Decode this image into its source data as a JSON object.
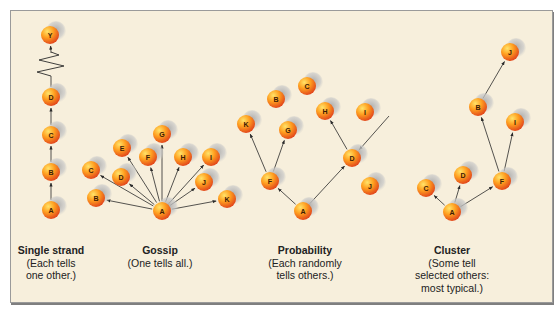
{
  "colors": {
    "background": "#f7efdc",
    "node_fill_light": "#ffd04a",
    "node_fill_dark": "#e8501a",
    "shadow": "#b8b8b8",
    "arrow": "#2a2a2a"
  },
  "panels": [
    {
      "id": "single-strand",
      "title": "Single strand",
      "description": "(Each tells\none other.)",
      "caption_x": 51,
      "nodes": [
        {
          "label": "Y",
          "x": 50,
          "y": 35
        },
        {
          "label": "D",
          "x": 51,
          "y": 97
        },
        {
          "label": "C",
          "x": 51,
          "y": 135
        },
        {
          "label": "B",
          "x": 51,
          "y": 172
        },
        {
          "label": "A",
          "x": 51,
          "y": 210
        }
      ],
      "edges": [
        [
          "A",
          "B"
        ],
        [
          "B",
          "C"
        ],
        [
          "C",
          "D"
        ]
      ],
      "break": {
        "from_y": 80,
        "to_y": 48,
        "x": 51
      }
    },
    {
      "id": "gossip",
      "title": "Gossip",
      "description": "(One tells all.)",
      "caption_x": 160,
      "nodes": [
        {
          "label": "A",
          "x": 162,
          "y": 211
        },
        {
          "label": "B",
          "x": 96,
          "y": 198
        },
        {
          "label": "C",
          "x": 91,
          "y": 170
        },
        {
          "label": "D",
          "x": 121,
          "y": 177
        },
        {
          "label": "E",
          "x": 122,
          "y": 148
        },
        {
          "label": "F",
          "x": 148,
          "y": 157
        },
        {
          "label": "G",
          "x": 162,
          "y": 134
        },
        {
          "label": "H",
          "x": 183,
          "y": 157
        },
        {
          "label": "I",
          "x": 211,
          "y": 157
        },
        {
          "label": "J",
          "x": 204,
          "y": 182
        },
        {
          "label": "K",
          "x": 227,
          "y": 199
        }
      ],
      "edges": [
        [
          "A",
          "B"
        ],
        [
          "A",
          "C"
        ],
        [
          "A",
          "D"
        ],
        [
          "A",
          "E"
        ],
        [
          "A",
          "F"
        ],
        [
          "A",
          "G"
        ],
        [
          "A",
          "H"
        ],
        [
          "A",
          "I"
        ],
        [
          "A",
          "J"
        ],
        [
          "A",
          "K"
        ]
      ]
    },
    {
      "id": "probability",
      "title": "Probability",
      "description": "(Each randomly\ntells others.)",
      "caption_x": 305,
      "nodes": [
        {
          "label": "A",
          "x": 303,
          "y": 211
        },
        {
          "label": "B",
          "x": 276,
          "y": 99
        },
        {
          "label": "C",
          "x": 307,
          "y": 86
        },
        {
          "label": "D",
          "x": 352,
          "y": 158
        },
        {
          "label": "F",
          "x": 270,
          "y": 181
        },
        {
          "label": "G",
          "x": 288,
          "y": 130
        },
        {
          "label": "H",
          "x": 325,
          "y": 111
        },
        {
          "label": "I",
          "x": 365,
          "y": 112
        },
        {
          "label": "J",
          "x": 370,
          "y": 186
        },
        {
          "label": "K",
          "x": 246,
          "y": 124
        }
      ],
      "edges": [
        [
          "A",
          "F"
        ],
        [
          "A",
          "D"
        ],
        [
          "F",
          "K"
        ],
        [
          "F",
          "G"
        ],
        [
          "D",
          "H"
        ]
      ],
      "incoming": {
        "to": "D",
        "from_x": 389,
        "from_y": 116
      }
    },
    {
      "id": "cluster",
      "title": "Cluster",
      "description": "(Some tell\nselected others:\nmost typical.)",
      "caption_x": 452,
      "nodes": [
        {
          "label": "A",
          "x": 452,
          "y": 212
        },
        {
          "label": "C",
          "x": 426,
          "y": 188
        },
        {
          "label": "D",
          "x": 463,
          "y": 175
        },
        {
          "label": "F",
          "x": 502,
          "y": 181
        },
        {
          "label": "B",
          "x": 478,
          "y": 107
        },
        {
          "label": "I",
          "x": 515,
          "y": 122
        },
        {
          "label": "J",
          "x": 510,
          "y": 52
        }
      ],
      "edges": [
        [
          "A",
          "C"
        ],
        [
          "A",
          "D"
        ],
        [
          "A",
          "F"
        ],
        [
          "F",
          "B"
        ],
        [
          "F",
          "I"
        ],
        [
          "B",
          "J"
        ]
      ]
    }
  ]
}
